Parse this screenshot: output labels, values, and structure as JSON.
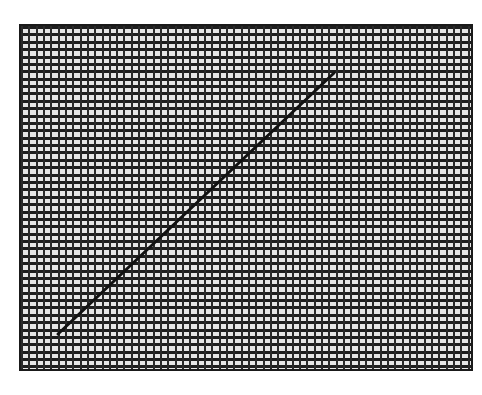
{
  "chart_data": {
    "type": "line",
    "title": "",
    "xlabel": "",
    "ylabel": "",
    "grid": true,
    "legend": null,
    "plot_area_px": {
      "x0": 19,
      "y0": 24,
      "x1": 473,
      "y1": 371
    },
    "grid_cells": {
      "columns": 62,
      "rows": 47
    },
    "series": [
      {
        "name": "line",
        "color": "#111111",
        "points_px": [
          [
            58,
            334
          ],
          [
            334,
            73
          ]
        ]
      }
    ],
    "colors": {
      "background": "#ffffff",
      "grid_fill": "#e6e6e6",
      "grid_lines": "#222222",
      "border": "#1a1a1a",
      "line": "#111111"
    }
  }
}
